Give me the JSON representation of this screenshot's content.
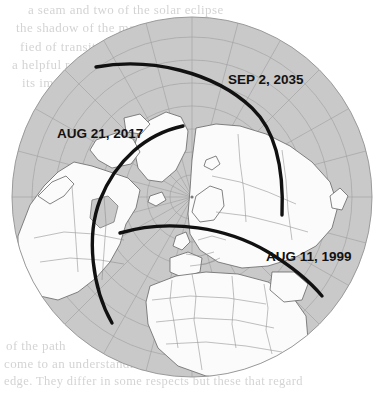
{
  "figure": {
    "name": "polar-eclipse-path-map",
    "projection": "north-polar-azimuthal",
    "center_pole_label": "North Pole",
    "colors": {
      "paper": "#ffffff",
      "ocean": "#c9c9c9",
      "land": "#fbfbfb",
      "graticule": "#9a9a9a",
      "coastline": "#6d6d6d",
      "border": "#8a8a8a",
      "path_line": "#111111",
      "label_text": "#121212",
      "bleed_text": "#b9b9bb"
    },
    "disc": {
      "cx": 192,
      "cy": 197,
      "r": 180
    }
  },
  "eclipse_paths": [
    {
      "id": "path-2035",
      "label": "SEP 2, 2035",
      "label_x": 228,
      "label_y": 84,
      "stroke_width": 3.4
    },
    {
      "id": "path-2017",
      "label": "AUG 21, 2017",
      "label_x": 57,
      "label_y": 138,
      "stroke_width": 3.4
    },
    {
      "id": "path-1999",
      "label": "AUG 11, 1999",
      "label_x": 266,
      "label_y": 261,
      "stroke_width": 3.4
    }
  ],
  "bleed_through_text": {
    "note": "faint mirrored ink showing through from the reverse page; not legible",
    "top_lines": [
      "a seam and two of the solar eclipse",
      "the shadow of the moon sweeps",
      "fied of transits of the sun and the",
      "a helpful reference to those who",
      "its impact on the shadow track"
    ],
    "bottom_lines": [
      "of the path",
      "come to an understanding by mov",
      "edge. They differ in some respects but these that regard"
    ]
  }
}
